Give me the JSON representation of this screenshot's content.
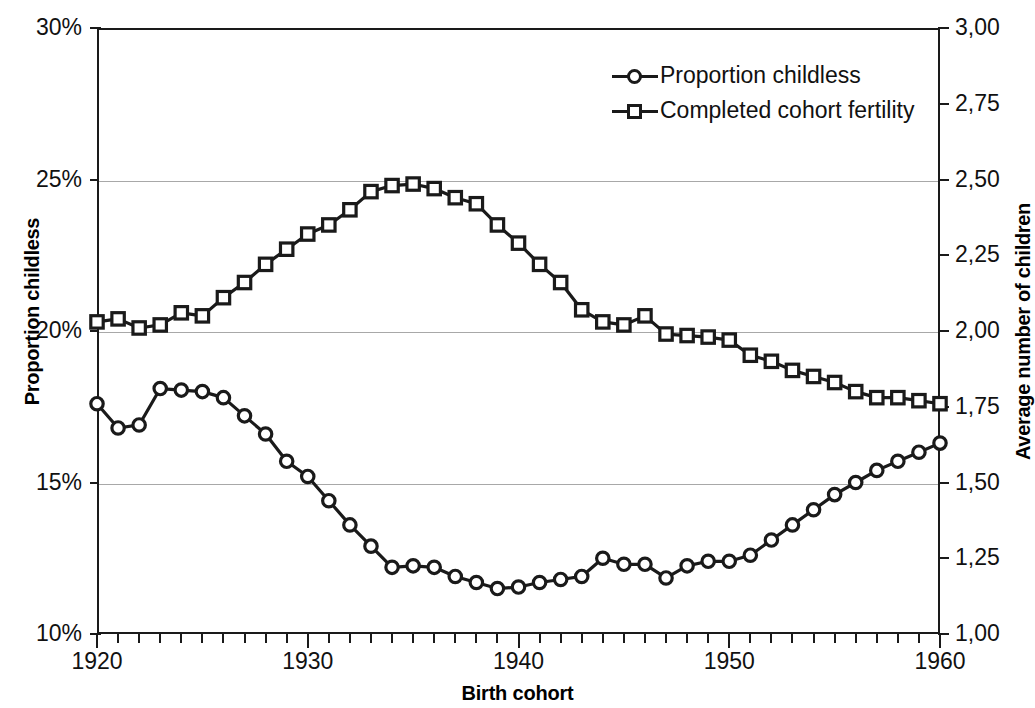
{
  "chart_data": {
    "type": "line",
    "title": "",
    "xlabel": "Birth cohort",
    "ylabel": "Proportion childless",
    "ylabel_secondary": "Average number of children",
    "x": [
      1920,
      1921,
      1922,
      1923,
      1924,
      1925,
      1926,
      1927,
      1928,
      1929,
      1930,
      1931,
      1932,
      1933,
      1934,
      1935,
      1936,
      1937,
      1938,
      1939,
      1940,
      1941,
      1942,
      1943,
      1944,
      1945,
      1946,
      1947,
      1948,
      1949,
      1950,
      1951,
      1952,
      1953,
      1954,
      1955,
      1956,
      1957,
      1958,
      1959,
      1960
    ],
    "xlim": [
      1920,
      1960
    ],
    "xticks": [
      1920,
      1930,
      1940,
      1950,
      1960
    ],
    "xtick_labels": [
      "1920",
      "1930",
      "1940",
      "1950",
      "1960"
    ],
    "xtick_interval": 1,
    "ylim": [
      10,
      30
    ],
    "yticks": [
      10,
      15,
      20,
      25,
      30
    ],
    "ytick_labels": [
      "10%",
      "15%",
      "20%",
      "25%",
      "30%"
    ],
    "ylim_secondary": [
      1.0,
      3.0
    ],
    "yticks_secondary": [
      1.0,
      1.25,
      1.5,
      1.75,
      2.0,
      2.25,
      2.5,
      2.75,
      3.0
    ],
    "ytick_labels_secondary": [
      "1,00",
      "1,25",
      "1,50",
      "1,75",
      "2,00",
      "2,25",
      "2,50",
      "2,75",
      "3,00"
    ],
    "grid": "horizontal",
    "gridlines": [
      15,
      20,
      25
    ],
    "legend_position": "top-right",
    "series": [
      {
        "name": "Proportion childless",
        "axis": "left",
        "unit": "%",
        "marker": "circle",
        "values": [
          17.6,
          16.8,
          16.9,
          18.1,
          18.05,
          18.0,
          17.8,
          17.2,
          16.6,
          15.7,
          15.2,
          14.4,
          13.6,
          12.9,
          12.2,
          12.25,
          12.2,
          11.9,
          11.7,
          11.5,
          11.55,
          11.7,
          11.8,
          11.9,
          12.5,
          12.3,
          12.3,
          11.85,
          12.25,
          12.4,
          12.4,
          12.6,
          13.1,
          13.6,
          14.1,
          14.6,
          15.0,
          15.4,
          15.7,
          16.0,
          16.3
        ]
      },
      {
        "name": "Completed cohort fertility",
        "axis": "right",
        "unit": "children",
        "marker": "square",
        "values": [
          2.03,
          2.04,
          2.01,
          2.02,
          2.06,
          2.05,
          2.11,
          2.16,
          2.22,
          2.27,
          2.32,
          2.35,
          2.4,
          2.46,
          2.48,
          2.485,
          2.47,
          2.44,
          2.42,
          2.35,
          2.29,
          2.22,
          2.16,
          2.07,
          2.03,
          2.02,
          2.05,
          1.99,
          1.985,
          1.98,
          1.97,
          1.92,
          1.9,
          1.87,
          1.85,
          1.83,
          1.8,
          1.78,
          1.78,
          1.77,
          1.76
        ]
      }
    ]
  },
  "legend": {
    "items": [
      {
        "label": "Proportion childless",
        "marker": "circle"
      },
      {
        "label": "Completed cohort fertility",
        "marker": "square"
      }
    ]
  },
  "axes": {
    "x_title": "Birth cohort",
    "y_left_title": "Proportion childless",
    "y_right_title": "Average number of children"
  },
  "colors": {
    "line": "#1a1a1a",
    "grid": "#a8a8a8",
    "background": "#ffffff",
    "text": "#111111"
  }
}
